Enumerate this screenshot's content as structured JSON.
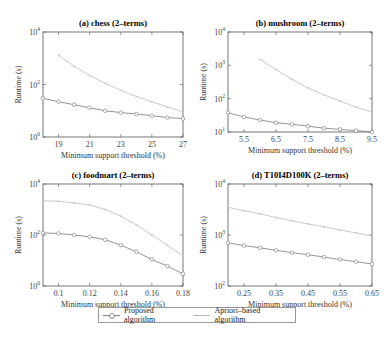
{
  "chart_data": [
    {
      "type": "line",
      "title": "(a) chess (2-terms)",
      "xlabel": "Minimum support threshold (%)",
      "ylabel": "Runtime (s)",
      "yscale": "log",
      "ylim": [
        1,
        10000
      ],
      "ytick_labels": [
        "10^0",
        "10^2",
        "10^4"
      ],
      "xlim": [
        18,
        27
      ],
      "xtick_labels": [
        "19",
        "21",
        "23",
        "25",
        "27"
      ],
      "x": [
        18,
        19,
        20,
        21,
        22,
        23,
        24,
        25,
        26,
        27
      ],
      "series": [
        {
          "name": "Proposed algorithm",
          "values": [
            30,
            22,
            17,
            13,
            10,
            8.5,
            7.5,
            6.5,
            5.5,
            5
          ]
        },
        {
          "name": "Apriori-based algorithm",
          "values": [
            null,
            1300,
            500,
            220,
            110,
            60,
            35,
            22,
            14,
            9
          ]
        }
      ],
      "grid": false
    },
    {
      "type": "line",
      "title": "(b) mushroom (2-terms)",
      "xlabel": "Minimum support threshold (%)",
      "ylabel": "Runtime (s)",
      "yscale": "log",
      "ylim": [
        10,
        10000
      ],
      "ytick_labels": [
        "10^1",
        "10^2",
        "10^3",
        "10^4"
      ],
      "xlim": [
        5,
        9.5
      ],
      "xtick_labels": [
        "5.5",
        "6.5",
        "7.5",
        "8.5",
        "9.5"
      ],
      "x": [
        5,
        5.5,
        6,
        6.5,
        7,
        7.5,
        8,
        8.5,
        9,
        9.5
      ],
      "series": [
        {
          "name": "Proposed algorithm",
          "values": [
            38,
            28,
            23,
            19,
            17,
            15,
            13,
            12,
            11,
            10
          ]
        },
        {
          "name": "Apriori-based algorithm",
          "values": [
            null,
            null,
            1500,
            750,
            380,
            210,
            130,
            85,
            55,
            40
          ]
        }
      ],
      "grid": false
    },
    {
      "type": "line",
      "title": "(c) foodmart (2-terms)",
      "xlabel": "Minimum support threshold (%)",
      "ylabel": "Runtime (s)",
      "yscale": "log",
      "ylim": [
        1,
        10000
      ],
      "ytick_labels": [
        "10^0",
        "10^2",
        "10^4"
      ],
      "xlim": [
        0.09,
        0.18
      ],
      "xtick_labels": [
        "0.1",
        "0.12",
        "0.14",
        "0.16",
        "0.18"
      ],
      "x": [
        0.09,
        0.1,
        0.11,
        0.12,
        0.13,
        0.14,
        0.15,
        0.16,
        0.17,
        0.18
      ],
      "series": [
        {
          "name": "Proposed algorithm",
          "values": [
            120,
            115,
            100,
            85,
            65,
            40,
            22,
            11,
            6,
            3
          ]
        },
        {
          "name": "Apriori-based algorithm",
          "values": [
            2200,
            2100,
            1800,
            1500,
            1000,
            550,
            250,
            100,
            40,
            15
          ]
        }
      ],
      "grid": false
    },
    {
      "type": "line",
      "title": "(d) T10I4D100K (2-terms)",
      "xlabel": "Minimum support threshold (%)",
      "ylabel": "Runtime (s)",
      "yscale": "log",
      "ylim": [
        100,
        10000
      ],
      "ytick_labels": [
        "10^2",
        "10^3",
        "10^4"
      ],
      "xlim": [
        0.2,
        0.65
      ],
      "xtick_labels": [
        "0.25",
        "0.35",
        "0.45",
        "0.55",
        "0.65"
      ],
      "x": [
        0.2,
        0.25,
        0.3,
        0.35,
        0.4,
        0.45,
        0.5,
        0.55,
        0.6,
        0.65
      ],
      "series": [
        {
          "name": "Proposed algorithm",
          "values": [
            700,
            620,
            560,
            500,
            450,
            410,
            370,
            330,
            300,
            270
          ]
        },
        {
          "name": "Apriori-based algorithm",
          "values": [
            3500,
            3000,
            2600,
            2200,
            1900,
            1650,
            1450,
            1250,
            1100,
            950
          ]
        }
      ],
      "grid": false
    }
  ],
  "legend": {
    "items": [
      "Proposed algorithm",
      "Apriori–based algorithm"
    ],
    "position": "bottom-center"
  },
  "labels": {
    "a_title": "(a) chess (2–terms)",
    "b_title": "(b) mushroom (2–terms)",
    "c_title": "(c) foodmart (2–terms)",
    "d_title": "(d) T10I4D100K (2–terms)",
    "xlabel": "Minimum support threshold (%)",
    "ylabel": "Runtime (s)"
  }
}
